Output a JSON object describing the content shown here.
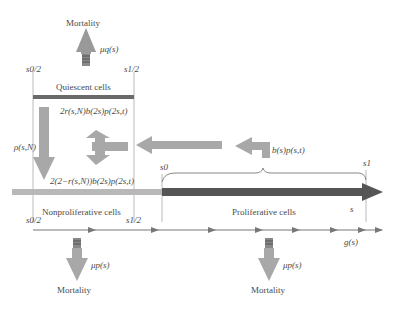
{
  "diagram": {
    "top_mortality": {
      "label": "Mortality",
      "rate": "μq(s)"
    },
    "quiescent": {
      "label": "Quiescent cells",
      "left_bound": "s0/2",
      "right_bound": "s1/2"
    },
    "transition_rate": "ρ(s,N)",
    "return_flux_top": "2r(s,N)b(2s)p(2s,t)",
    "return_flux_bottom": "2(2−r(s,N))b(2s)p(2s,t)",
    "division_flux": "b(s)p(s,t)",
    "nonproliferative": {
      "label": "Nonproliferative cells",
      "left_bound": "s0/2",
      "right_bound": "s1/2"
    },
    "proliferative": {
      "label": "Proliferative cells",
      "start": "s0",
      "end": "s1",
      "size_var": "s"
    },
    "growth_rate": "g(s)",
    "bottom_mortality_left": {
      "label": "Mortality",
      "rate": "μp(s)"
    },
    "bottom_mortality_right": {
      "label": "Mortality",
      "rate": "μp(s)"
    },
    "colors": {
      "arrow_fill": "#a8a8a8",
      "dark_bar": "#555555",
      "light_bar": "#b8b8b8",
      "line": "#777777"
    }
  }
}
